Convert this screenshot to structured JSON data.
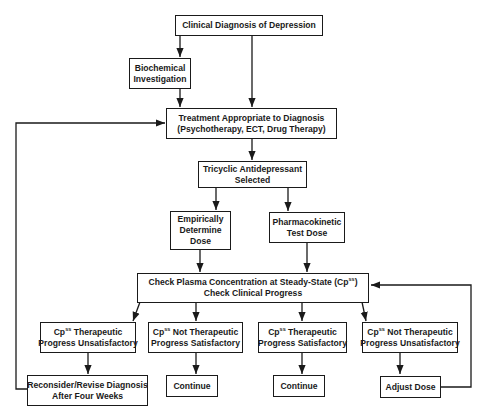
{
  "diagram": {
    "type": "flowchart",
    "nodes": {
      "clinical_diagnosis": {
        "lines": [
          "Clinical Diagnosis of Depression"
        ]
      },
      "biochemical": {
        "lines": [
          "Biochemical",
          "Investigation"
        ]
      },
      "treatment": {
        "lines": [
          "Treatment Appropriate to Diagnosis",
          "(Psychotherapy, ECT, Drug Therapy)"
        ]
      },
      "tricyclic": {
        "lines": [
          "Tricyclic Antidepressant",
          "Selected"
        ]
      },
      "empirical": {
        "lines": [
          "Empirically",
          "Determine",
          "Dose"
        ]
      },
      "pk_test": {
        "lines": [
          "Pharmacokinetic",
          "Test Dose"
        ]
      },
      "check": {
        "line1_prefix": "Check Plasma Concentration at Steady-State (Cp",
        "line1_sup": "ss",
        "line1_suffix": ")",
        "line2": "Check Clinical Progress"
      },
      "out1": {
        "prefix": "Cp",
        "sup": "ss",
        "rest": " Therapeutic",
        "line2": "Progress Unsatisfactory"
      },
      "out2": {
        "prefix": "Cp",
        "sup": "ss",
        "rest": " Not Therapeutic",
        "line2": "Progress Satisfactory"
      },
      "out3": {
        "prefix": "Cp",
        "sup": "ss",
        "rest": " Therapeutic",
        "line2": "Progress Satisfactory"
      },
      "out4": {
        "prefix": "Cp",
        "sup": "ss",
        "rest": " Not Therapeutic",
        "line2": "Progress Unsatisfactory"
      },
      "reconsider": {
        "lines": [
          "Reconsider/Revise Diagnosis",
          "After Four Weeks"
        ]
      },
      "continue1": {
        "lines": [
          "Continue"
        ]
      },
      "continue2": {
        "lines": [
          "Continue"
        ]
      },
      "adjust": {
        "lines": [
          "Adjust Dose"
        ]
      }
    },
    "edges": [
      [
        "clinical_diagnosis",
        "biochemical"
      ],
      [
        "clinical_diagnosis",
        "treatment"
      ],
      [
        "biochemical",
        "treatment"
      ],
      [
        "treatment",
        "tricyclic"
      ],
      [
        "tricyclic",
        "empirical"
      ],
      [
        "tricyclic",
        "pk_test"
      ],
      [
        "empirical",
        "check"
      ],
      [
        "pk_test",
        "check"
      ],
      [
        "check",
        "out1"
      ],
      [
        "check",
        "out2"
      ],
      [
        "check",
        "out3"
      ],
      [
        "check",
        "out4"
      ],
      [
        "out1",
        "reconsider"
      ],
      [
        "out2",
        "continue1"
      ],
      [
        "out3",
        "continue2"
      ],
      [
        "out4",
        "adjust"
      ],
      [
        "reconsider",
        "treatment"
      ],
      [
        "adjust",
        "check"
      ]
    ],
    "colors": {
      "line": "#1a1a1a",
      "background": "#ffffff"
    }
  }
}
